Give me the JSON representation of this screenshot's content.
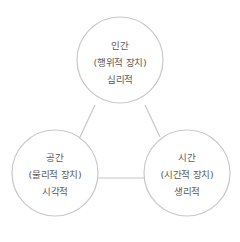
{
  "diagram": {
    "type": "triangle-of-circles",
    "colors": {
      "stroke": "#c8c8c8",
      "text": "#5a5a5a",
      "background": "#ffffff"
    },
    "nodes": [
      {
        "id": "human",
        "title": "인간",
        "subtitle": "(행위적 장치)",
        "aspect": "심리적"
      },
      {
        "id": "space",
        "title": "공간",
        "subtitle": "(물리적 장치)",
        "aspect": "시각적"
      },
      {
        "id": "time",
        "title": "시간",
        "subtitle": "(시간적 장치)",
        "aspect": "생리적"
      }
    ],
    "edges": [
      {
        "from": "human",
        "to": "space"
      },
      {
        "from": "human",
        "to": "time"
      },
      {
        "from": "space",
        "to": "time"
      }
    ]
  }
}
